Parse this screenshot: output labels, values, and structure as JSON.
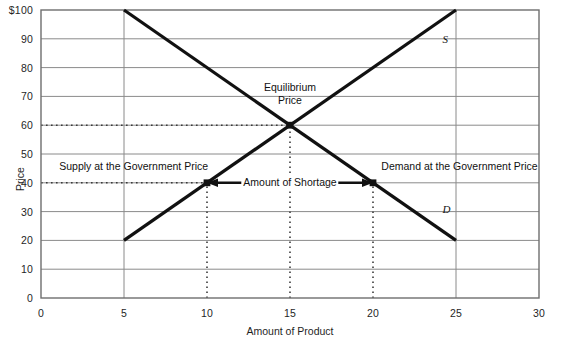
{
  "chart_data": {
    "type": "line",
    "title": "",
    "xlabel": "Amount of Product",
    "ylabel": "Price",
    "xlim": [
      0,
      30
    ],
    "ylim": [
      0,
      100
    ],
    "grid": true,
    "legend": "inline-curve-labels",
    "x_ticks": [
      "0",
      "5",
      "10",
      "15",
      "20",
      "25",
      "30"
    ],
    "x_tick_values": [
      0,
      5,
      10,
      15,
      20,
      25,
      30
    ],
    "y_ticks": [
      "0",
      "10",
      "20",
      "30",
      "40",
      "50",
      "60",
      "70",
      "80",
      "90",
      "$100"
    ],
    "y_tick_values": [
      0,
      10,
      20,
      30,
      40,
      50,
      60,
      70,
      80,
      90,
      100
    ],
    "series": [
      {
        "name": "D",
        "label": "D",
        "description": "Demand curve, downward sloping",
        "points": [
          [
            5,
            100
          ],
          [
            25,
            20
          ]
        ],
        "color": "#111111"
      },
      {
        "name": "S",
        "label": "S",
        "description": "Supply curve, upward sloping",
        "points": [
          [
            5,
            20
          ],
          [
            25,
            100
          ]
        ],
        "color": "#111111"
      }
    ],
    "reference_lines": [
      {
        "name": "equilibrium-price-line",
        "type": "horizontal",
        "value": 60,
        "style": "dotted",
        "from_x": 0,
        "to_x": 15
      },
      {
        "name": "government-price-line",
        "type": "horizontal",
        "value": 40,
        "style": "dotted",
        "from_x": 0,
        "to_x": 20
      },
      {
        "name": "equilibrium-quantity-line",
        "type": "vertical",
        "value": 15,
        "style": "dotted",
        "from_y": 0,
        "to_y": 60
      },
      {
        "name": "supply-quantity-line",
        "type": "vertical",
        "value": 10,
        "style": "dotted",
        "from_y": 0,
        "to_y": 40
      },
      {
        "name": "demand-quantity-line",
        "type": "vertical",
        "value": 20,
        "style": "dotted",
        "from_y": 0,
        "to_y": 40
      }
    ],
    "markers": [
      {
        "name": "equilibrium-point",
        "x": 15,
        "y": 60
      },
      {
        "name": "supply-at-government-price-point",
        "x": 10,
        "y": 40
      },
      {
        "name": "demand-at-government-price-point",
        "x": 20,
        "y": 40
      }
    ],
    "annotations": [
      {
        "name": "equilibrium-price",
        "text_line1": "Equilibrium",
        "text_line2": "Price",
        "x": 15,
        "y": 73
      },
      {
        "name": "supply-at-government-price",
        "text": "Supply at the Government Price",
        "x": 9,
        "y": 46
      },
      {
        "name": "demand-at-government-price",
        "text": "Demand at the Government Price",
        "x": 22.5,
        "y": 46
      },
      {
        "name": "amount-of-shortage",
        "text": "Amount of Shortage",
        "x": 15,
        "y": 40,
        "arrow": "double-headed",
        "arrow_from_x": 10,
        "arrow_to_x": 20
      }
    ]
  },
  "labels": {
    "y_axis_title": "Price",
    "x_axis_title": "Amount of Product",
    "supply_curve": "S",
    "demand_curve": "D",
    "equilibrium_line1": "Equilibrium",
    "equilibrium_line2": "Price",
    "supply_at_gov": "Supply at the Government Price",
    "demand_at_gov": "Demand at the Government Price",
    "shortage": "Amount of Shortage"
  },
  "colors": {
    "curve": "#111111",
    "grid": "#8a8a8a",
    "axis": "#6e6e6e",
    "background": "#ffffff",
    "text": "#1a1a1a"
  }
}
